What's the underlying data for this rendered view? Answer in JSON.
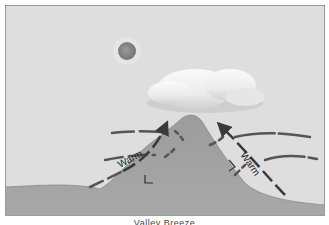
{
  "diagram": {
    "caption": "Valley Breeze",
    "labels": {
      "left_air": "Warm",
      "right_air": "Warm"
    },
    "elements": [
      "sun",
      "cloud",
      "mountain",
      "warm-air-arrows",
      "dashed-airflow-lines"
    ],
    "colors": {
      "sky": "#dedede",
      "mountain": "#a4a4a4",
      "ground": "#a8a8a8",
      "arrow": "#3a3a3a",
      "sun": "#8a8a8a",
      "cloud": "#f4f4f4"
    }
  }
}
